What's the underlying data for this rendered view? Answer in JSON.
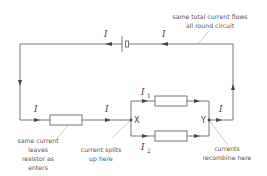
{
  "diagram": {
    "type": "series-parallel circuit",
    "current_symbols": {
      "top_left": "I",
      "top_right": "I",
      "bottom_left": "I",
      "before_junction": "I",
      "branch_top": "I",
      "branch_top_sub": "1",
      "branch_bottom": "I",
      "branch_bottom_sub": "2",
      "after_junction": "I"
    },
    "nodes": {
      "split": "X",
      "join": "Y"
    },
    "annotations": {
      "top": [
        "same total current flows",
        "all round circuit"
      ],
      "resistor": [
        "same current",
        "leaves",
        "resistor as",
        "enters"
      ],
      "split": [
        "current splits",
        "up here"
      ],
      "join": [
        "currents",
        "recombine here"
      ]
    },
    "colors": {
      "wire": "#555555",
      "text": "#555555"
    }
  }
}
